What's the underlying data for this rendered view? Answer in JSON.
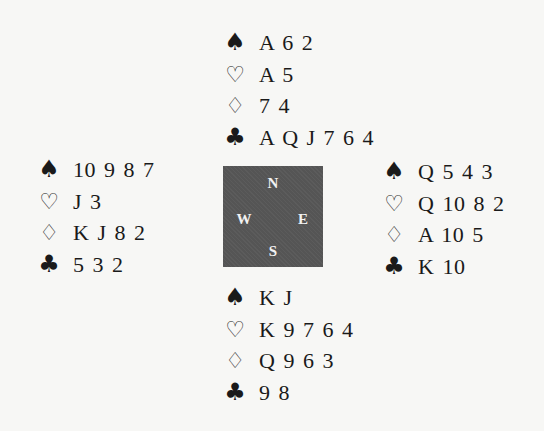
{
  "suit_symbols": {
    "spades": "♠",
    "hearts": "♡",
    "diamonds": "♢",
    "clubs": "♣"
  },
  "compass": {
    "north": "N",
    "south": "S",
    "west": "W",
    "east": "E",
    "background_color": "#555555"
  },
  "hands": {
    "north": {
      "spades": "A 6 2",
      "hearts": "A 5",
      "diamonds": "7 4",
      "clubs": "A Q J 7 6 4"
    },
    "west": {
      "spades": "10 9 8 7",
      "hearts": "J 3",
      "diamonds": "K J 8 2",
      "clubs": "5 3 2"
    },
    "east": {
      "spades": "Q 5 4 3",
      "hearts": "Q 10 8 2",
      "diamonds": "A 10 5",
      "clubs": "K 10"
    },
    "south": {
      "spades": "K J",
      "hearts": "K 9 7 6 4",
      "diamonds": "Q 9 6 3",
      "clubs": "9 8"
    }
  }
}
